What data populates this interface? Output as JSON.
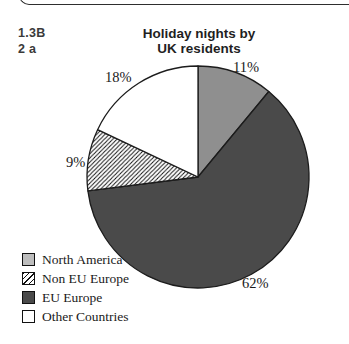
{
  "annotations": {
    "line1": "1.3B",
    "line2": "2 a"
  },
  "chart_data": {
    "type": "pie",
    "title_line1": "Holiday nights by",
    "title_line2": "UK residents",
    "legend_position": "bottom-left",
    "stroke_color": "#1c1c1c",
    "hatch_line_color": "#111111",
    "segments": [
      {
        "id": "north-america",
        "label": "North America",
        "value": 11,
        "pct_label": "11%",
        "fill": "#8f8f8f",
        "legend_fill": "#bdbdbd",
        "hatch": false
      },
      {
        "id": "eu-europe",
        "label": "EU Europe",
        "value": 62,
        "pct_label": "62%",
        "fill": "#4a4a4a",
        "legend_fill": "#4a4a4a",
        "hatch": false
      },
      {
        "id": "non-eu-europe",
        "label": "Non EU Europe",
        "value": 9,
        "pct_label": "9%",
        "fill": "#ffffff",
        "legend_fill": "#ffffff",
        "hatch": true
      },
      {
        "id": "other-countries",
        "label": "Other Countries",
        "value": 18,
        "pct_label": "18%",
        "fill": "#ffffff",
        "legend_fill": "#ffffff",
        "hatch": false
      }
    ],
    "legend_order": [
      0,
      2,
      1,
      3
    ]
  }
}
